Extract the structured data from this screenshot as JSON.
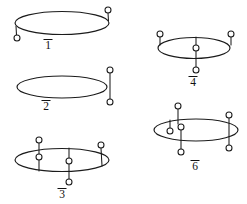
{
  "figure": {
    "background_color": "#ffffff",
    "ink_color": "#1b1b1b",
    "node_fill_color": "#ffffff",
    "label_color": "#111111"
  },
  "diagrams": [
    {
      "id": "diagram-1",
      "label": "1",
      "label_overlined": true,
      "ellipse": {
        "cx": 62,
        "cy": 23,
        "rx": 47,
        "ry": 11.5
      },
      "endpoints": [
        {
          "name": "upper-right-node",
          "cx": 108,
          "cy": 10,
          "r": 3.0
        },
        {
          "name": "lower-left-node",
          "cx": 17,
          "cy": 38,
          "r": 3.0
        }
      ],
      "strands": [
        {
          "name": "right-stem",
          "d": "M 108 13 L 108.5 21"
        },
        {
          "name": "left-stem",
          "d": "M 16.5 35 L 16 26"
        }
      ],
      "label_pos": {
        "x": 48,
        "y": 49
      }
    },
    {
      "id": "diagram-2",
      "label": "2",
      "label_overlined": true,
      "ellipse": {
        "cx": 62,
        "cy": 87,
        "rx": 45,
        "ry": 11.0
      },
      "endpoints": [
        {
          "name": "upper-node",
          "cx": 110,
          "cy": 70,
          "r": 3.0
        },
        {
          "name": "lower-node",
          "cx": 110,
          "cy": 102,
          "r": 3.0
        }
      ],
      "strands": [
        {
          "name": "vertical-stem",
          "d": "M 110 73 L 110 99"
        }
      ],
      "label_pos": {
        "x": 46,
        "y": 110
      }
    },
    {
      "id": "diagram-3",
      "label": "3",
      "label_overlined": true,
      "ellipse": {
        "cx": 62,
        "cy": 160,
        "rx": 47,
        "ry": 11.5
      },
      "endpoints": [
        {
          "name": "top-left-node",
          "cx": 39,
          "cy": 140,
          "r": 3.0
        },
        {
          "name": "mid-left-node",
          "cx": 39,
          "cy": 157,
          "r": 3.0
        },
        {
          "name": "mid-center-node",
          "cx": 69,
          "cy": 161,
          "r": 3.0
        },
        {
          "name": "bottom-center-node",
          "cx": 69,
          "cy": 182,
          "r": 3.0
        },
        {
          "name": "top-right-node",
          "cx": 101,
          "cy": 145,
          "r": 3.0
        }
      ],
      "strands": [
        {
          "name": "left-stem",
          "d": "M 39 143 L 39 154"
        },
        {
          "name": "left-stem-lower",
          "d": "M 39 160 L 39 171"
        },
        {
          "name": "center-stem",
          "d": "M 69 148 L 69 158"
        },
        {
          "name": "center-stem-lower",
          "d": "M 69 164 L 69 179"
        },
        {
          "name": "right-stem",
          "d": "M 101 148 L 102 166"
        }
      ],
      "label_pos": {
        "x": 62,
        "y": 198
      }
    },
    {
      "id": "diagram-4",
      "label": "4",
      "label_overlined": true,
      "ellipse": {
        "cx": 194,
        "cy": 48,
        "rx": 36,
        "ry": 10.5
      },
      "endpoints": [
        {
          "name": "top-left-node",
          "cx": 160,
          "cy": 34,
          "r": 3.0
        },
        {
          "name": "top-right-node",
          "cx": 231,
          "cy": 34,
          "r": 3.0
        },
        {
          "name": "center-node",
          "cx": 196,
          "cy": 48,
          "r": 3.0
        },
        {
          "name": "bottom-center-node",
          "cx": 196,
          "cy": 70,
          "r": 3.0
        }
      ],
      "strands": [
        {
          "name": "left-stem",
          "d": "M 160 37 L 160 45"
        },
        {
          "name": "right-stem",
          "d": "M 231 37 L 231 45"
        },
        {
          "name": "center-stem",
          "d": "M 196 37 L 196 45"
        },
        {
          "name": "center-stem-lower",
          "d": "M 196 51 L 196 67"
        }
      ],
      "label_pos": {
        "x": 193,
        "y": 86
      }
    },
    {
      "id": "diagram-6",
      "label": "6",
      "label_overlined": true,
      "ellipse": {
        "cx": 196,
        "cy": 130,
        "rx": 42,
        "ry": 11.0
      },
      "endpoints": [
        {
          "name": "top-center-node",
          "cx": 178,
          "cy": 106,
          "r": 3.0
        },
        {
          "name": "left-inner-node",
          "cx": 170,
          "cy": 131,
          "r": 3.0
        },
        {
          "name": "mid-inner-node",
          "cx": 181,
          "cy": 127,
          "r": 3.0
        },
        {
          "name": "bottom-center-node",
          "cx": 181,
          "cy": 152,
          "r": 3.0
        },
        {
          "name": "right-top-node",
          "cx": 229,
          "cy": 115,
          "r": 3.0
        },
        {
          "name": "right-bottom-node",
          "cx": 229,
          "cy": 148,
          "r": 3.0
        }
      ],
      "strands": [
        {
          "name": "top-stem",
          "d": "M 178 109 L 178 124"
        },
        {
          "name": "left-inner-stem",
          "d": "M 170 128 L 170 120"
        },
        {
          "name": "mid-inner-stem",
          "d": "M 181 130 L 181 149"
        },
        {
          "name": "right-stem",
          "d": "M 229 118 L 229 145"
        }
      ],
      "label_pos": {
        "x": 195,
        "y": 170
      }
    }
  ]
}
